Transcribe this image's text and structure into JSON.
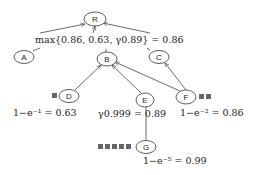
{
  "diagram": {
    "nodes": [
      {
        "id": "R",
        "label": "R",
        "cx": 95,
        "cy": 19
      },
      {
        "id": "A",
        "label": "A",
        "cx": 24,
        "cy": 57
      },
      {
        "id": "B",
        "label": "B",
        "cx": 107,
        "cy": 59
      },
      {
        "id": "C",
        "label": "C",
        "cx": 159,
        "cy": 57
      },
      {
        "id": "D",
        "label": "D",
        "cx": 69,
        "cy": 96
      },
      {
        "id": "E",
        "label": "E",
        "cx": 145,
        "cy": 100
      },
      {
        "id": "F",
        "label": "F",
        "cx": 186,
        "cy": 97
      },
      {
        "id": "G",
        "label": "G",
        "cx": 146,
        "cy": 147
      }
    ],
    "edges": [
      {
        "from": "B",
        "to": "R",
        "type": "arrow"
      },
      {
        "from": "D",
        "to": "B",
        "type": "arrow"
      },
      {
        "from": "E",
        "to": "B",
        "type": "arrow"
      },
      {
        "from": "F",
        "to": "B",
        "type": "arrow"
      },
      {
        "from": "F",
        "to": "C",
        "type": "arrow"
      },
      {
        "from": "E",
        "to": "G",
        "type": "line"
      }
    ],
    "formulas": {
      "root": "max{0.86, 0.63, γ0.89} = 0.86",
      "d": "1−e⁻¹ = 0.63",
      "e": "γ0.999 = 0.89",
      "f": "1−e⁻² = 0.86",
      "g": "1−e⁻⁵ = 0.99"
    },
    "squares": {
      "D": 1,
      "F": 2,
      "G": 5
    }
  }
}
